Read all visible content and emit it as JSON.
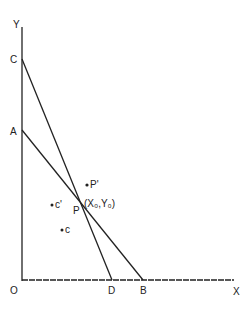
{
  "diagram": {
    "axes": {
      "y_label": "Y",
      "x_label": "X",
      "origin_label": "O"
    },
    "points": {
      "C": "C",
      "A": "A",
      "D": "D",
      "B": "B",
      "P": "P",
      "P_prime": "P'",
      "P_coords": "(X₀,Y₀)",
      "c_prime": "c'",
      "c": "c"
    },
    "lines": [
      {
        "name": "AB",
        "from": "A",
        "to": "B"
      },
      {
        "name": "CD",
        "from": "C",
        "to": "D"
      }
    ],
    "stroke_color": "#222222"
  }
}
